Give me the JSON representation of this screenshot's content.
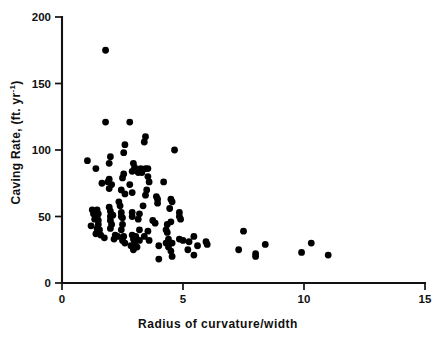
{
  "chart_data": {
    "type": "scatter",
    "title": "",
    "xlabel": "Radius of curvature/width",
    "ylabel": "Caving Rate, (ft. yr",
    "ylabel_exponent": "-1",
    "ylabel_suffix": ")",
    "xlim": [
      0,
      15
    ],
    "ylim": [
      0,
      200
    ],
    "xticks": [
      0,
      5,
      10,
      15
    ],
    "xticklabels": [
      "0",
      "5",
      "10",
      "15"
    ],
    "yticks": [
      0,
      50,
      100,
      150,
      200
    ],
    "yticklabels": [
      "0",
      "50",
      "100",
      "150",
      "200"
    ],
    "grid": false,
    "legend": null,
    "marker": "filled-circle",
    "marker_color": "#000000",
    "marker_size_px": 3.4,
    "points": [
      [
        1.8,
        175
      ],
      [
        1.8,
        121
      ],
      [
        2.8,
        121
      ],
      [
        3.45,
        110
      ],
      [
        3.4,
        106
      ],
      [
        2.6,
        104
      ],
      [
        2.55,
        98
      ],
      [
        2.0,
        95
      ],
      [
        4.65,
        100
      ],
      [
        1.05,
        92
      ],
      [
        1.95,
        90
      ],
      [
        2.95,
        90
      ],
      [
        3.0,
        87
      ],
      [
        3.25,
        86
      ],
      [
        3.45,
        86
      ],
      [
        3.55,
        86
      ],
      [
        3.3,
        83
      ],
      [
        2.9,
        84
      ],
      [
        3.15,
        83
      ],
      [
        1.4,
        86
      ],
      [
        2.55,
        82
      ],
      [
        2.5,
        79
      ],
      [
        1.95,
        78
      ],
      [
        1.9,
        76
      ],
      [
        3.55,
        80
      ],
      [
        1.65,
        75
      ],
      [
        2.05,
        74
      ],
      [
        3.6,
        76
      ],
      [
        4.2,
        76
      ],
      [
        2.8,
        74
      ],
      [
        1.95,
        71
      ],
      [
        2.45,
        70
      ],
      [
        3.5,
        70
      ],
      [
        2.6,
        67
      ],
      [
        2.9,
        68
      ],
      [
        3.45,
        66
      ],
      [
        3.9,
        65
      ],
      [
        3.95,
        63
      ],
      [
        4.5,
        63
      ],
      [
        4.55,
        61
      ],
      [
        3.95,
        60
      ],
      [
        3.35,
        58
      ],
      [
        1.95,
        57
      ],
      [
        1.25,
        55
      ],
      [
        1.45,
        55
      ],
      [
        2.0,
        54
      ],
      [
        2.45,
        53
      ],
      [
        2.9,
        53
      ],
      [
        1.3,
        52
      ],
      [
        1.5,
        52
      ],
      [
        1.45,
        50
      ],
      [
        2.0,
        50
      ],
      [
        2.45,
        50
      ],
      [
        2.9,
        50
      ],
      [
        4.85,
        53
      ],
      [
        4.85,
        50
      ],
      [
        4.9,
        48
      ],
      [
        1.35,
        48
      ],
      [
        1.5,
        47
      ],
      [
        2.0,
        47
      ],
      [
        2.5,
        49
      ],
      [
        3.75,
        47
      ],
      [
        1.2,
        43
      ],
      [
        1.5,
        44
      ],
      [
        2.05,
        44
      ],
      [
        3.85,
        45
      ],
      [
        4.35,
        44
      ],
      [
        1.45,
        41
      ],
      [
        1.55,
        40
      ],
      [
        2.0,
        41
      ],
      [
        2.45,
        40
      ],
      [
        3.2,
        40
      ],
      [
        3.55,
        39
      ],
      [
        4.3,
        40
      ],
      [
        4.35,
        38
      ],
      [
        7.5,
        39
      ],
      [
        1.4,
        37
      ],
      [
        1.6,
        36
      ],
      [
        2.2,
        36
      ],
      [
        2.3,
        35
      ],
      [
        2.55,
        35
      ],
      [
        2.9,
        36
      ],
      [
        3.05,
        35
      ],
      [
        3.4,
        35
      ],
      [
        1.75,
        34
      ],
      [
        2.15,
        33
      ],
      [
        2.5,
        32
      ],
      [
        2.95,
        33
      ],
      [
        3.2,
        32
      ],
      [
        4.4,
        33
      ],
      [
        4.85,
        33
      ],
      [
        5.0,
        32
      ],
      [
        5.45,
        35
      ],
      [
        2.6,
        30
      ],
      [
        3.0,
        30
      ],
      [
        4.3,
        30
      ],
      [
        4.45,
        30
      ],
      [
        4.55,
        30
      ],
      [
        5.25,
        31
      ],
      [
        5.95,
        31
      ],
      [
        6.0,
        29
      ],
      [
        2.85,
        28
      ],
      [
        3.1,
        27
      ],
      [
        4.0,
        28
      ],
      [
        4.4,
        27
      ],
      [
        5.6,
        28
      ],
      [
        8.4,
        29
      ],
      [
        10.3,
        30
      ],
      [
        2.95,
        25
      ],
      [
        4.5,
        24
      ],
      [
        5.2,
        25
      ],
      [
        5.45,
        21
      ],
      [
        7.3,
        25
      ],
      [
        8.0,
        22
      ],
      [
        8.0,
        20
      ],
      [
        9.9,
        23
      ],
      [
        11.0,
        21
      ],
      [
        4.0,
        18
      ],
      [
        4.55,
        20
      ],
      [
        2.35,
        61
      ],
      [
        2.4,
        58
      ],
      [
        4.45,
        56
      ],
      [
        4.5,
        46
      ],
      [
        3.2,
        52
      ],
      [
        3.15,
        48
      ],
      [
        2.5,
        44
      ],
      [
        3.6,
        32
      ],
      [
        2.1,
        51
      ],
      [
        1.45,
        38
      ]
    ]
  }
}
